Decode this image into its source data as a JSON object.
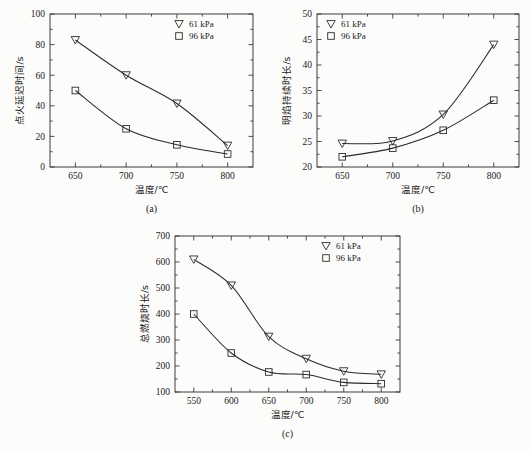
{
  "figure": {
    "panels": [
      "a",
      "b",
      "c"
    ]
  },
  "legend": {
    "series1_label": "61 kPa",
    "series2_label": "96 kPa",
    "series1_marker": "triangle-down-marker",
    "series2_marker": "square-marker"
  },
  "panel_a": {
    "caption": "(a)",
    "xlabel": "温度/℃",
    "ylabel": "点火延迟时间/s",
    "legend_position": "top-right"
  },
  "panel_b": {
    "caption": "(b)",
    "xlabel": "温度/℃",
    "ylabel": "明焰持续时长/s",
    "legend_position": "top-left"
  },
  "panel_c": {
    "caption": "(c)",
    "xlabel": "温度/℃",
    "ylabel": "总燃烧时长/s",
    "legend_position": "top-right"
  },
  "chart_data": [
    {
      "id": "a",
      "type": "scatter",
      "title": "(a)",
      "xlabel": "温度/℃",
      "ylabel": "点火延迟时间/s",
      "x": [
        650,
        700,
        750,
        800
      ],
      "xticks": [
        650,
        700,
        750,
        800
      ],
      "xlim": [
        625,
        825
      ],
      "yticks": [
        0,
        20,
        40,
        60,
        80,
        100
      ],
      "ylim": [
        0,
        100
      ],
      "grid": false,
      "legend": "top-right",
      "series": [
        {
          "name": "61 kPa",
          "marker": "triangle-down",
          "values": [
            83,
            60,
            41.5,
            14
          ]
        },
        {
          "name": "96 kPa",
          "marker": "square",
          "values": [
            50,
            25,
            14.5,
            8.5
          ]
        }
      ]
    },
    {
      "id": "b",
      "type": "scatter",
      "title": "(b)",
      "xlabel": "温度/℃",
      "ylabel": "明焰持续时长/s",
      "x": [
        650,
        700,
        750,
        800
      ],
      "xticks": [
        650,
        700,
        750,
        800
      ],
      "xlim": [
        625,
        825
      ],
      "yticks": [
        20,
        25,
        30,
        35,
        40,
        45,
        50
      ],
      "ylim": [
        20,
        50
      ],
      "grid": false,
      "legend": "top-left",
      "series": [
        {
          "name": "61 kPa",
          "marker": "triangle-down",
          "values": [
            24.6,
            25.1,
            30.3,
            44.0
          ]
        },
        {
          "name": "96 kPa",
          "marker": "square",
          "values": [
            22.0,
            23.7,
            27.2,
            33.1
          ]
        }
      ]
    },
    {
      "id": "c",
      "type": "scatter",
      "title": "(c)",
      "xlabel": "温度/℃",
      "ylabel": "总燃烧时长/s",
      "x": [
        550,
        600,
        650,
        700,
        750,
        800
      ],
      "xticks": [
        550,
        600,
        650,
        700,
        750,
        800
      ],
      "xlim": [
        525,
        825
      ],
      "yticks": [
        100,
        200,
        300,
        400,
        500,
        600,
        700
      ],
      "ylim": [
        100,
        700
      ],
      "grid": false,
      "legend": "top-right",
      "series": [
        {
          "name": "61 kPa",
          "marker": "triangle-down",
          "values": [
            610,
            510,
            313,
            228,
            180,
            168
          ]
        },
        {
          "name": "96 kPa",
          "marker": "square",
          "values": [
            400,
            250,
            177,
            167,
            137,
            132
          ]
        }
      ]
    }
  ]
}
